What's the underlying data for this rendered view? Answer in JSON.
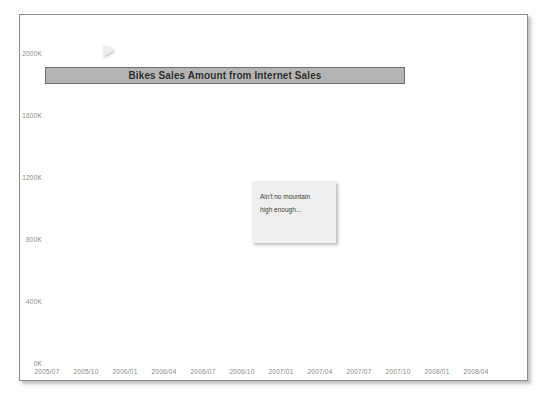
{
  "chart_data": {
    "type": "line",
    "title": "Bikes Sales Amount from Internet Sales",
    "xlabel": "",
    "ylabel": "",
    "ylim": [
      0,
      2000
    ],
    "y_unit": "K",
    "grid": true,
    "legend": "none",
    "y_ticks": [
      "0K",
      "400K",
      "800K",
      "1200K",
      "1600K",
      "2000K"
    ],
    "y_tick_values": [
      0,
      400,
      800,
      1200,
      1600,
      2000
    ],
    "x_ticks": [
      "2005/07",
      "2005/10",
      "2006/01",
      "2006/04",
      "2006/07",
      "2006/10",
      "2007/01",
      "2007/04",
      "2007/07",
      "2007/10",
      "2008/01",
      "2008/04"
    ],
    "annotations": [
      {
        "name": "callout",
        "lines": [
          "Ain't no mountain",
          "high enough..."
        ]
      }
    ],
    "x": [
      "2005/07",
      "2005/08",
      "2005/09",
      "2005/10",
      "2005/11",
      "2005/12",
      "2006/01",
      "2006/02",
      "2006/03",
      "2006/04",
      "2006/05",
      "2006/06",
      "2006/07",
      "2006/08",
      "2006/09",
      "2006/10",
      "2006/11",
      "2006/12",
      "2007/01",
      "2007/02",
      "2007/03",
      "2007/04",
      "2007/05",
      "2007/06",
      "2007/07",
      "2007/08",
      "2007/09",
      "2007/10",
      "2007/11",
      "2007/12",
      "2008/01",
      "2008/02",
      "2008/03",
      "2008/04",
      "2008/05",
      "2008/06"
    ],
    "series": [
      {
        "name": "Bikes Sales Amount",
        "color": "#606060",
        "values": [
          470,
          490,
          465,
          505,
          500,
          760,
          640,
          530,
          640,
          660,
          690,
          600,
          500,
          545,
          365,
          415,
          330,
          500,
          580,
          430,
          480,
          480,
          500,
          545,
          520,
          880,
          850,
          1030,
          1020,
          1640,
          1230,
          1430,
          1410,
          1500,
          1700,
          1830
        ]
      }
    ]
  }
}
